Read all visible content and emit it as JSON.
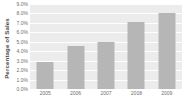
{
  "chart_data": {
    "type": "bar",
    "title": "",
    "xlabel": "",
    "ylabel": "Percentage of Sales",
    "categories": [
      "2005",
      "2006",
      "2007",
      "2008",
      "2009"
    ],
    "values": [
      2.9,
      4.6,
      5.0,
      7.1,
      8.0
    ],
    "ylim": [
      0,
      9
    ],
    "ytick_values": [
      0,
      1,
      2,
      3,
      4,
      5,
      6,
      7,
      8,
      9
    ],
    "ytick_labels": [
      "0.0%",
      "1.0%",
      "2.0%",
      "3.0%",
      "4.0%",
      "5.0%",
      "6.0%",
      "7.0%",
      "8.0%",
      "9.0%"
    ],
    "grid": true,
    "legend": false,
    "colors": {
      "bar": "#b6b6b6",
      "plot_background": "#ececec",
      "gridline": "#ffffff",
      "tick_text": "#6e6e6e",
      "axis_title_text": "#4a4a4a",
      "figure_background": "#ffffff"
    }
  }
}
